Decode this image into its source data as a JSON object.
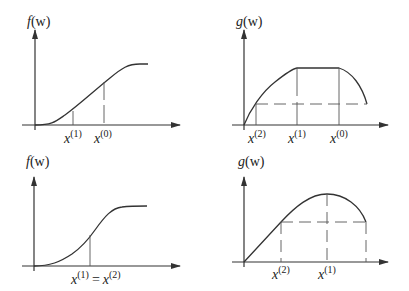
{
  "panels": {
    "top_left": {
      "ylabel": "f(w)",
      "ylabel_base": "f",
      "ylabel_arg": "(w)",
      "ticks": [
        {
          "base": "x",
          "sup": "(1)"
        },
        {
          "base": "x",
          "sup": "(0)"
        }
      ]
    },
    "top_right": {
      "ylabel_base": "g",
      "ylabel_arg": "(w)",
      "ticks": [
        {
          "base": "x",
          "sup": "(2)"
        },
        {
          "base": "x",
          "sup": "(1)"
        },
        {
          "base": "x",
          "sup": "(0)"
        }
      ]
    },
    "bottom_left": {
      "ylabel_base": "f",
      "ylabel_arg": "(w)",
      "tick": {
        "left_base": "x",
        "left_sup": "(1)",
        "eq": "=",
        "right_base": "x",
        "right_sup": "(2)"
      }
    },
    "bottom_right": {
      "ylabel_base": "g",
      "ylabel_arg": "(w)",
      "ticks": [
        {
          "base": "x",
          "sup": "(2)"
        },
        {
          "base": "x",
          "sup": "(1)"
        }
      ]
    }
  },
  "colors": {
    "line": "#333333",
    "guide": "#555555",
    "background": "#ffffff"
  }
}
